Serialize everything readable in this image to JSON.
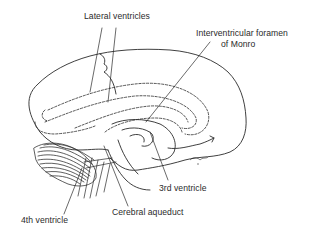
{
  "diagram": {
    "style": "black line drawing on white",
    "colors": {
      "line": "#2a2a2a",
      "background": "#ffffff"
    },
    "labels": [
      {
        "id": "lateral-ventricles",
        "text": "Lateral ventricles"
      },
      {
        "id": "interventricular-foramen-line1",
        "text": "Interventricular foramen"
      },
      {
        "id": "interventricular-foramen-line2",
        "text": "of Monro"
      },
      {
        "id": "third-ventricle",
        "text": "3rd ventricle"
      },
      {
        "id": "cerebral-aqueduct",
        "text": "Cerebral aqueduct"
      },
      {
        "id": "fourth-ventricle",
        "text": "4th ventricle"
      }
    ],
    "signature": "artist signature (illegible)"
  }
}
